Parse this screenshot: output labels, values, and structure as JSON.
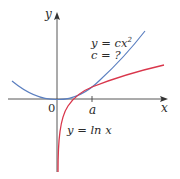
{
  "diagram": {
    "axes": {
      "x_label": "x",
      "y_label": "y",
      "origin_label": "0",
      "tick_label": "a"
    },
    "curves": [
      {
        "name": "parabola",
        "equation_lhs": "y = cx",
        "exponent": "2",
        "color": "#5b7fc0"
      },
      {
        "name": "natural-log",
        "equation": "y = ln x",
        "color": "#d9364b"
      }
    ],
    "question": "c = ?",
    "colors": {
      "axis": "#444444",
      "text": "#2b2b2b",
      "parabola": "#5b7fc0",
      "log": "#d9364b",
      "background": "#ffffff"
    }
  }
}
